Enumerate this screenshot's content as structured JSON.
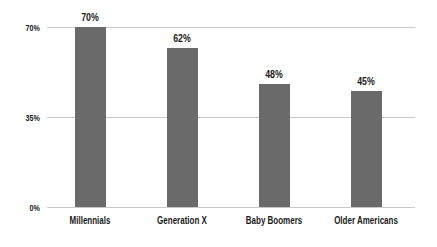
{
  "chart_data": {
    "type": "bar",
    "title": "",
    "xlabel": "",
    "ylabel": "",
    "categories": [
      "Millennials",
      "Generation X",
      "Baby Boomers",
      "Older Americans"
    ],
    "values": [
      70,
      62,
      48,
      45
    ],
    "value_labels": [
      "70%",
      "62%",
      "48%",
      "45%"
    ],
    "ylim": [
      0,
      70
    ],
    "yticks": [
      {
        "value": 70,
        "label": "70%"
      },
      {
        "value": 35,
        "label": "35%"
      },
      {
        "value": 0,
        "label": "0%"
      }
    ],
    "grid": true,
    "legend": "none",
    "colors": {
      "bar": "#6a6a6a",
      "gridline": "#c9c9c9",
      "text": "#1a1a1a",
      "background": "#ffffff"
    }
  }
}
